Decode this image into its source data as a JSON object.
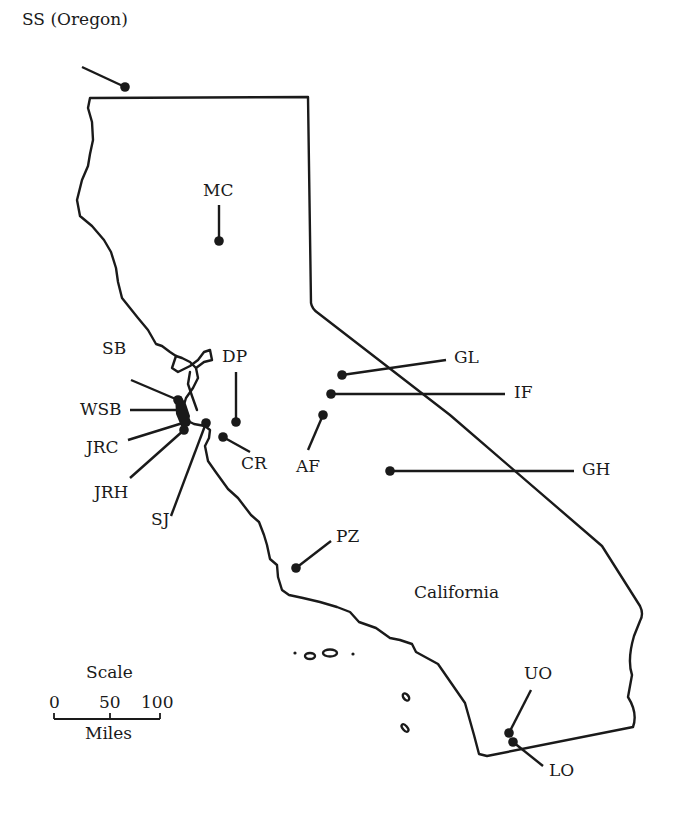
{
  "map": {
    "region_label": "California",
    "colors": {
      "ink": "#1a1a1a",
      "background": "#ffffff"
    },
    "sites": [
      {
        "id": "SS",
        "label": "SS (Oregon)",
        "dot": [
          125,
          87
        ],
        "leader_end": [
          82,
          67
        ],
        "label_pos": [
          22,
          11
        ]
      },
      {
        "id": "MC",
        "label": "MC",
        "dot": [
          219,
          241
        ],
        "leader_end": [
          219,
          205
        ],
        "label_pos": [
          203,
          182
        ]
      },
      {
        "id": "DP",
        "label": "DP",
        "dot": [
          236,
          422
        ],
        "leader_end": [
          236,
          372
        ],
        "label_pos": [
          222,
          348
        ]
      },
      {
        "id": "SB",
        "label": "SB",
        "dot": [
          178,
          400
        ],
        "leader_end": [
          131,
          380
        ],
        "label_pos": [
          102,
          340
        ]
      },
      {
        "id": "WSB",
        "label": "WSB",
        "dot": [
          181,
          410
        ],
        "leader_end": [
          130,
          410
        ],
        "label_pos": [
          80,
          401
        ]
      },
      {
        "id": "JRC",
        "label": "JRC",
        "dot": [
          186,
          422
        ],
        "leader_end": [
          128,
          440
        ],
        "label_pos": [
          86,
          439
        ]
      },
      {
        "id": "JRH",
        "label": "JRH",
        "dot": [
          184,
          430
        ],
        "leader_end": [
          130,
          478
        ],
        "label_pos": [
          94,
          484
        ]
      },
      {
        "id": "SJ",
        "label": "SJ",
        "dot": [
          206,
          423
        ],
        "leader_end": [
          171,
          516
        ],
        "label_pos": [
          151,
          511
        ]
      },
      {
        "id": "CR",
        "label": "CR",
        "dot": [
          223,
          437
        ],
        "leader_end": [
          250,
          452
        ],
        "label_pos": [
          241,
          455
        ]
      },
      {
        "id": "GL",
        "label": "GL",
        "dot": [
          342,
          375
        ],
        "leader_end": [
          446,
          360
        ],
        "label_pos": [
          454,
          349
        ]
      },
      {
        "id": "IF",
        "label": "IF",
        "dot": [
          331,
          394
        ],
        "leader_end": [
          505,
          394
        ],
        "label_pos": [
          514,
          384
        ]
      },
      {
        "id": "AF",
        "label": "AF",
        "dot": [
          323,
          415
        ],
        "leader_end": [
          308,
          450
        ],
        "label_pos": [
          296,
          458
        ]
      },
      {
        "id": "GH",
        "label": "GH",
        "dot": [
          390,
          471
        ],
        "leader_end": [
          574,
          471
        ],
        "label_pos": [
          582,
          461
        ]
      },
      {
        "id": "PZ",
        "label": "PZ",
        "dot": [
          296,
          568
        ],
        "leader_end": [
          331,
          541
        ],
        "label_pos": [
          336,
          528
        ]
      },
      {
        "id": "UO",
        "label": "UO",
        "dot": [
          509,
          733
        ],
        "leader_end": [
          531,
          690
        ],
        "label_pos": [
          524,
          665
        ]
      },
      {
        "id": "LO",
        "label": "LO",
        "dot": [
          513,
          742
        ],
        "leader_end": [
          543,
          766
        ],
        "label_pos": [
          549,
          762
        ]
      }
    ],
    "region_label_pos": [
      414,
      584
    ],
    "scale": {
      "title": "Scale",
      "ticks": [
        "0",
        "50",
        "100"
      ],
      "unit": "Miles"
    }
  }
}
